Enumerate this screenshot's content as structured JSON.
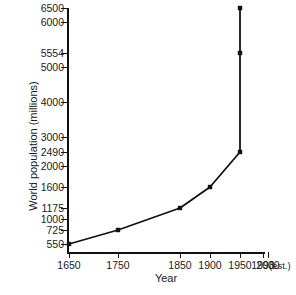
{
  "chart_data": {
    "type": "line",
    "title": "",
    "xlabel": "Year",
    "ylabel": "World population (millions)",
    "x": [
      1650,
      1750,
      1850,
      1900,
      1950,
      1993,
      2000
    ],
    "values": [
      550,
      725,
      1175,
      1600,
      2490,
      5554,
      6500
    ],
    "series": [
      {
        "name": "World population",
        "points": [
          {
            "year": "1650",
            "population": 550
          },
          {
            "year": "1750",
            "population": 725
          },
          {
            "year": "1850",
            "population": 1175
          },
          {
            "year": "1900",
            "population": 1600
          },
          {
            "year": "1950",
            "population": 2490
          },
          {
            "year": "1993",
            "population": 5554
          },
          {
            "year": "2000",
            "population": 6500
          }
        ]
      }
    ],
    "xtick_labels": [
      "1650",
      "1750",
      "1850",
      "1900",
      "1950",
      "1993",
      "2000"
    ],
    "xtick_note": "(est.)",
    "ytick_labels": [
      "6500",
      "6000",
      "5554",
      "5000",
      "4000",
      "3000",
      "2490",
      "2000",
      "1600",
      "1175",
      "1000",
      "725",
      "550"
    ],
    "ylim": [
      550,
      6500
    ],
    "xlim": [
      1650,
      2000
    ],
    "grid": false,
    "legend": null,
    "marker": "square",
    "line_color": "#111111",
    "marker_color": "#111111",
    "background": "#ffffff",
    "axis_scale_note": "Non-uniform (value-ordered) y tick spacing; x ticks unevenly spaced by year"
  },
  "axes": {
    "y_ticks": [
      {
        "label": "6500",
        "py": 0
      },
      {
        "label": "6000",
        "py": 14
      },
      {
        "label": "5554",
        "py": 45
      },
      {
        "label": "5000",
        "py": 59
      },
      {
        "label": "4000",
        "py": 94
      },
      {
        "label": "3000",
        "py": 129
      },
      {
        "label": "2490",
        "py": 144
      },
      {
        "label": "2000",
        "py": 158
      },
      {
        "label": "1600",
        "py": 179
      },
      {
        "label": "1175",
        "py": 200
      },
      {
        "label": "1000",
        "py": 211
      },
      {
        "label": "725",
        "py": 222
      },
      {
        "label": "550",
        "py": 236
      }
    ],
    "x_ticks": [
      {
        "label": "1650",
        "px": 2
      },
      {
        "label": "1750",
        "px": 51
      },
      {
        "label": "1850",
        "px": 113
      },
      {
        "label": "1900",
        "px": 143
      },
      {
        "label": "1950",
        "px": 173
      },
      {
        "label": "1993",
        "px": 196
      },
      {
        "label": "2000",
        "px": 201
      }
    ],
    "data_points_px": [
      {
        "px": 2,
        "py": 236
      },
      {
        "px": 51,
        "py": 222
      },
      {
        "px": 113,
        "py": 200
      },
      {
        "px": 143,
        "py": 179
      },
      {
        "px": 173,
        "py": 144
      },
      {
        "px": 173,
        "py": 45
      },
      {
        "px": 173,
        "py": 0
      }
    ]
  }
}
